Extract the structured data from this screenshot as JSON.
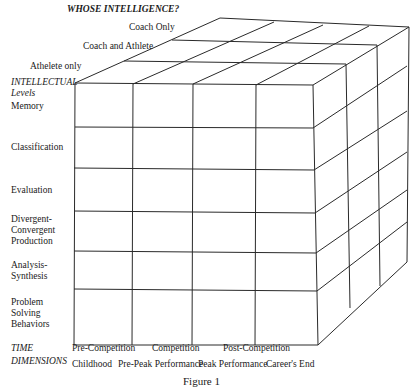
{
  "title": "WHOSE INTELLIGENCE?",
  "depth_axis": {
    "labels": [
      "Coach Only",
      "Coach and Athlete",
      "Athelete only"
    ]
  },
  "vertical_axis": {
    "heading_line1": "INTELLECTUAL",
    "heading_line2": "Levels",
    "levels": [
      {
        "lines": [
          "Memory"
        ]
      },
      {
        "lines": [
          "Classification"
        ]
      },
      {
        "lines": [
          "Evaluation"
        ]
      },
      {
        "lines": [
          "Divergent-",
          "Convergent",
          "Production"
        ]
      },
      {
        "lines": [
          "Analysis-",
          "Synthesis"
        ]
      },
      {
        "lines": [
          "Problem",
          "Solving",
          "Behaviors"
        ]
      }
    ]
  },
  "time_axis": {
    "heading_line1": "TIME",
    "heading_line2": "DIMENSIONS",
    "row1": [
      "Pre-Competition",
      "Competition",
      "Post-Competition"
    ],
    "row2": [
      "Childhood",
      "Pre-Peak Performance",
      "Peak Performance",
      "Career's End"
    ]
  },
  "caption": "Figure 1",
  "colors": {
    "line": "#2a2a2a",
    "text": "#1a1a1a",
    "background": "#ffffff"
  }
}
